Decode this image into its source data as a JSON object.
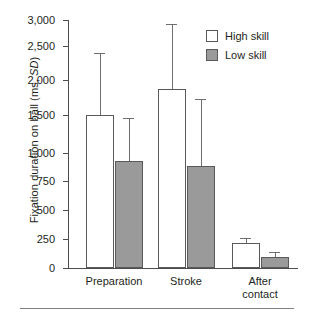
{
  "chart_data": {
    "type": "bar",
    "title": "",
    "xlabel": "",
    "ylabel": "Fixation duration on ball (ms, SD)",
    "ylabel_plain": "Fixation duration on ball (ms, ",
    "ylabel_italic": "SD",
    "ylabel_tail": ")",
    "categories": [
      "Preparation",
      "Stroke",
      "After\ncontact"
    ],
    "ytick_labels": [
      "3,000",
      "2,500",
      "2,000",
      "1,500",
      "1,000",
      "750",
      "500",
      "250",
      "0"
    ],
    "ytick_values": [
      3000,
      2500,
      2000,
      1500,
      1000,
      750,
      500,
      250,
      0
    ],
    "ylim": [
      0,
      3000
    ],
    "grid": false,
    "legend_position": "top-right",
    "series": [
      {
        "name": "High skill",
        "color": "#ffffff",
        "values": [
          1500,
          1875,
          215
        ],
        "errors": [
          900,
          1040,
          40
        ]
      },
      {
        "name": "Low skill",
        "color": "#9a9a9a",
        "values": [
          925,
          880,
          95
        ],
        "errors": [
          535,
          845,
          45
        ]
      }
    ]
  },
  "legend": {
    "items": [
      {
        "label": "High skill",
        "color": "#ffffff"
      },
      {
        "label": "Low skill",
        "color": "#9a9a9a"
      }
    ]
  },
  "axis": {
    "y_label_prefix": "Fixation duration on ball (ms, ",
    "y_label_italic": "SD",
    "y_label_suffix": ")"
  },
  "colors": {
    "high_skill": "#ffffff",
    "low_skill": "#9a9a9a",
    "axis": "#4d4d4d",
    "outline": "#58595b",
    "text": "#231f20"
  }
}
